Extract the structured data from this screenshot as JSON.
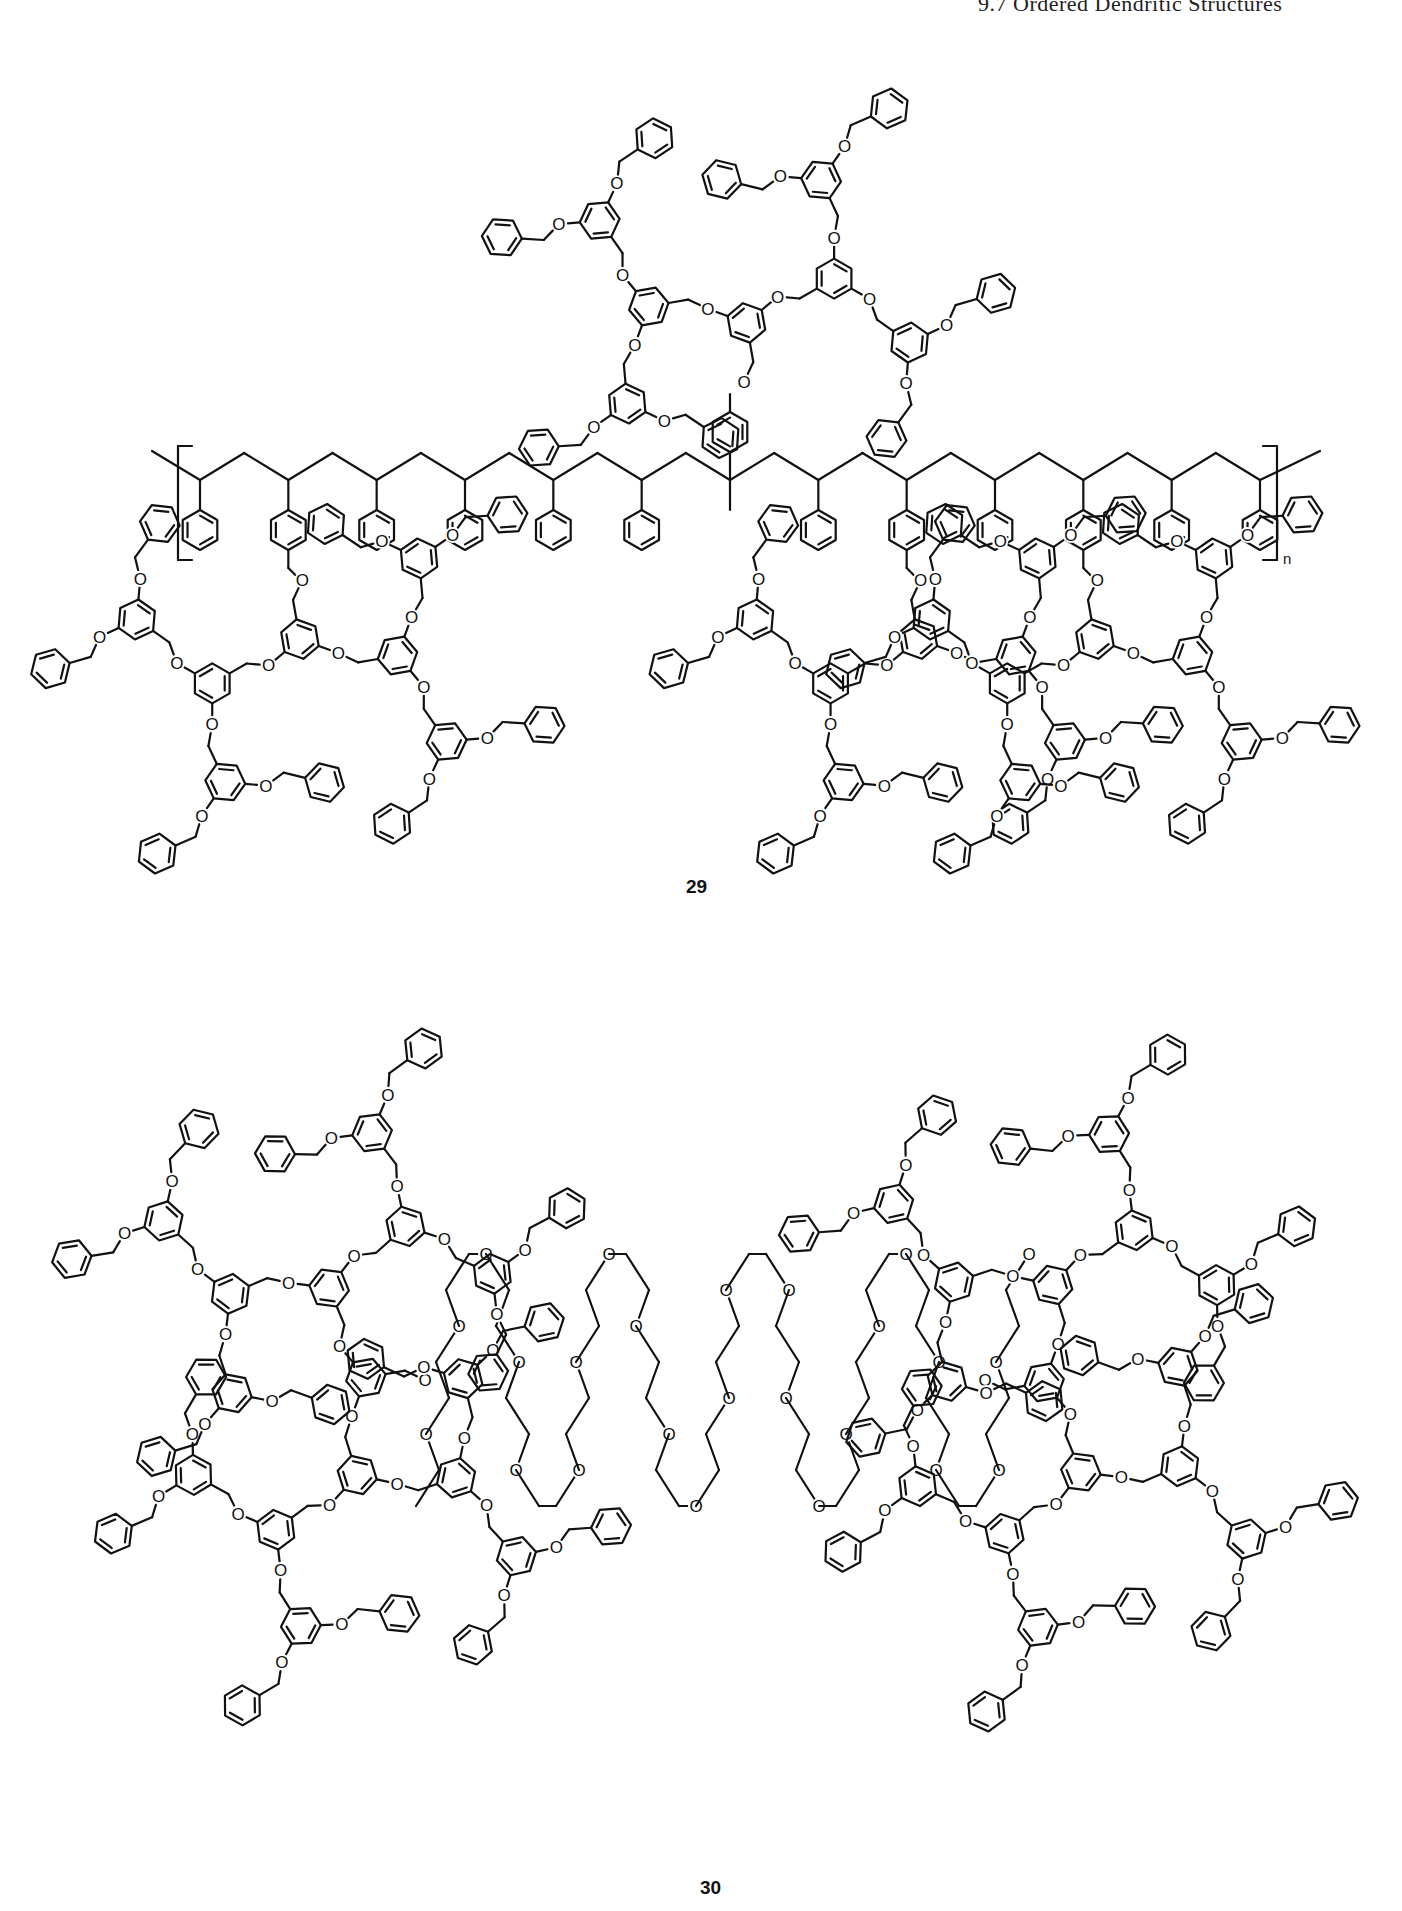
{
  "page": {
    "running_head": "9.7 Ordered Dendritic Structures",
    "background": "#ffffff",
    "ink": "#111111"
  },
  "figure": {
    "structures": [
      {
        "id": "29",
        "label": "29",
        "label_pos": [
          686,
          896
        ],
        "description": "Dendronized polystyrene: polystyrene backbone with pendant phenyl groups and third-generation poly(benzyl ether) Fréchet dendrons attached via benzyl ether linkages",
        "backbone": {
          "type": "polystyrene",
          "start": [
            160,
            465
          ],
          "end": [
            1300,
            465
          ],
          "repeat_units": 13,
          "bracket_left_x": 178,
          "bracket_right_x": 1277,
          "bracket_top": 446,
          "bracket_bottom": 560,
          "subscript": "n",
          "dendronized_positions": [
            1,
            8,
            10
          ]
        },
        "dendrons": [
          {
            "name": "top-dendron",
            "root": [
              816,
              428
            ],
            "direction": -90,
            "generation": 3
          },
          {
            "name": "bottom-left-dendron",
            "root": [
              300,
              560
            ],
            "direction": 90,
            "generation": 3
          },
          {
            "name": "bottom-right-dendron",
            "root": [
              990,
              560
            ],
            "direction": 90,
            "generation": 3
          }
        ]
      },
      {
        "id": "30",
        "label": "30",
        "label_pos": [
          700,
          1897
        ],
        "description": "Linear-dendritic block copolymer: two fourth-generation poly(benzyl ether) dendrons joined through a central poly(ethylene glycol) chain",
        "dendrons": [
          {
            "name": "left-dendron",
            "root": [
              425,
              1380
            ],
            "direction": 180,
            "generation": 4
          },
          {
            "name": "right-dendron",
            "root": [
              985,
              1380
            ],
            "direction": 0,
            "generation": 4
          }
        ],
        "peg_chain": {
          "atom_label": "O",
          "x_range": [
            425,
            985
          ],
          "y_center": 1380,
          "amplitude": 140,
          "folds": 8
        }
      }
    ],
    "atom_labels": {
      "oxygen": "O"
    }
  }
}
